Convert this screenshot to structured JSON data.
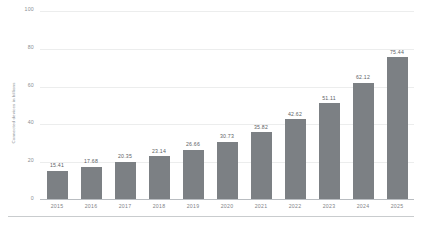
{
  "chart_data": {
    "type": "bar",
    "title": "",
    "subtitle": "",
    "xlabel": "",
    "ylabel": "Connected devices in billions",
    "categories": [
      "2015",
      "2016",
      "2017",
      "2018",
      "2019",
      "2020",
      "2021",
      "2022",
      "2023",
      "2024",
      "2025"
    ],
    "values": [
      15.41,
      17.68,
      20.35,
      23.14,
      26.66,
      30.73,
      35.82,
      42.62,
      51.11,
      62.12,
      75.44
    ],
    "value_labels": [
      "15.41",
      "17.68",
      "20.35",
      "23.14",
      "26.66",
      "30.73",
      "35.82",
      "42.62",
      "51.11",
      "62.12",
      "75.44"
    ],
    "ylim": [
      0,
      100
    ],
    "y_ticks": [
      100,
      80,
      60,
      40,
      20,
      0
    ],
    "y_tick_labels": [
      "100",
      "80",
      "60",
      "40",
      "20",
      "0"
    ],
    "grid": true,
    "grid_axis": "y",
    "legend": false,
    "legend_position": "none",
    "bar_color": "#7c8084",
    "grid_color": "#eceded",
    "axis_color": "#b9bdc1",
    "tick_label_color": "#8a8f94",
    "value_label_color": "#5d6266",
    "background_color": "#ffffff"
  }
}
